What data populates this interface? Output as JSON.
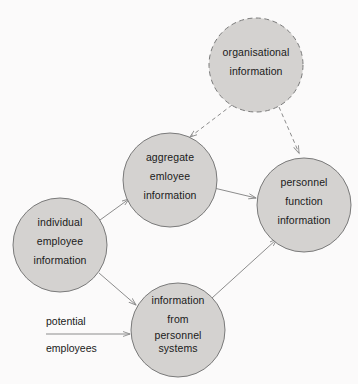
{
  "diagram": {
    "background_color": "#fbfafa",
    "node_fill_color": "#d4d2d0",
    "node_stroke_color": "#7a7a7a",
    "edge_color": "#8c8c8c",
    "text_color": "#1a1a1a",
    "nodes": [
      {
        "id": "organisational",
        "name": "organisational-information-node",
        "cx": 256,
        "cy": 65,
        "r": 47,
        "border_style": "dashed",
        "lines": [
          "organisational",
          "information"
        ]
      },
      {
        "id": "aggregate",
        "name": "aggregate-employee-information-node",
        "cx": 170,
        "cy": 180,
        "r": 47,
        "border_style": "solid",
        "lines": [
          "aggregate",
          "emloyee",
          "information"
        ]
      },
      {
        "id": "personnel_function",
        "name": "personnel-function-information-node",
        "cx": 304,
        "cy": 205,
        "r": 47,
        "border_style": "solid",
        "lines": [
          "personnel",
          "function",
          "information"
        ]
      },
      {
        "id": "individual",
        "name": "individual-employee-information-node",
        "cx": 60,
        "cy": 245,
        "r": 47,
        "border_style": "solid",
        "lines": [
          "individual",
          "employee",
          "information"
        ]
      },
      {
        "id": "information_from",
        "name": "information-from-personnel-systems-node",
        "cx": 178,
        "cy": 330,
        "r": 47,
        "border_style": "solid",
        "lines": [
          "information",
          "from",
          "personnel",
          "systems"
        ]
      }
    ],
    "edges": [
      {
        "id": "org_to_aggregate",
        "name": "edge-organisational-to-aggregate",
        "style": "dashed",
        "from": "organisational",
        "to": "aggregate"
      },
      {
        "id": "org_to_personnel",
        "name": "edge-organisational-to-personnel-function",
        "style": "dashed",
        "from": "organisational",
        "to": "personnel_function"
      },
      {
        "id": "individual_to_aggregate",
        "name": "edge-individual-to-aggregate",
        "style": "solid",
        "from": "individual",
        "to": "aggregate"
      },
      {
        "id": "individual_to_infofrom",
        "name": "edge-individual-to-information-from",
        "style": "solid",
        "from": "individual",
        "to": "information_from"
      },
      {
        "id": "aggregate_to_personnel",
        "name": "edge-aggregate-to-personnel-function",
        "style": "solid",
        "from": "aggregate",
        "to": "personnel_function"
      },
      {
        "id": "infofrom_to_personnel",
        "name": "edge-information-from-to-personnel-function",
        "style": "solid",
        "from": "information_from",
        "to": "personnel_function"
      },
      {
        "id": "potential_employees_inflow",
        "name": "edge-potential-employees-to-information-from",
        "style": "solid",
        "from": "potential_employees_label",
        "to": "information_from"
      }
    ],
    "edge_labels": [
      {
        "id": "potential_employees",
        "name": "potential-employees-label",
        "lines": [
          "potential",
          "employees"
        ],
        "x": 46,
        "y": 312
      }
    ]
  }
}
